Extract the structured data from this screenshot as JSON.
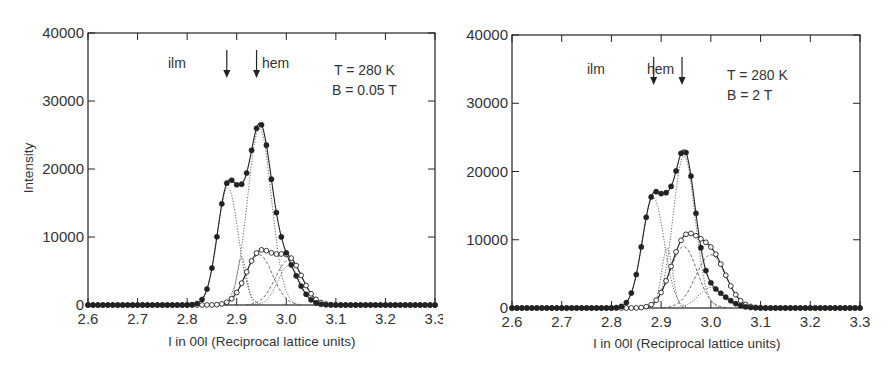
{
  "chart_data": [
    {
      "type": "line",
      "title": "",
      "xlabel": "l in 00l (Reciprocal lattice units)",
      "ylabel": "Intensity",
      "xlim": [
        2.6,
        3.3
      ],
      "ylim": [
        0,
        40000
      ],
      "xticks": [
        "2.6",
        "2.7",
        "2.8",
        "2.9",
        "3.0",
        "3.1",
        "3.2",
        "3.3"
      ],
      "yticks": [
        "0",
        "10000",
        "20000",
        "30000",
        "40000"
      ],
      "grid": false,
      "legend": null,
      "annotations": {
        "ilm_label": "ilm",
        "hem_label": "hem",
        "ilm_arrow_x": 2.88,
        "hem_arrow_x": 2.94,
        "temperature": "T = 280 K",
        "field": "B = 0.05 T"
      },
      "series": [
        {
          "name": "filled circles (total intensity, fit)",
          "marker": "filled-circle",
          "line": "solid",
          "components": [
            {
              "center": 2.882,
              "amplitude": 17300,
              "sigma": 0.021
            },
            {
              "center": 2.946,
              "amplitude": 26000,
              "sigma": 0.024
            },
            {
              "center": 2.91,
              "amplitude": 2200,
              "sigma": 0.012
            },
            {
              "center": 3.0,
              "amplitude": 5600,
              "sigma": 0.025
            }
          ],
          "peak": {
            "x": 2.92,
            "y": 31300
          }
        },
        {
          "name": "open circles (fit)",
          "marker": "open-circle",
          "line": "solid",
          "components": [
            {
              "center": 2.945,
              "amplitude": 7400,
              "sigma": 0.027
            },
            {
              "center": 3.005,
              "amplitude": 6600,
              "sigma": 0.027
            }
          ],
          "peak": {
            "x": 2.975,
            "y": 8700
          }
        }
      ],
      "dotted_components": [
        {
          "center": 2.882,
          "amplitude": 17300,
          "sigma": 0.021
        },
        {
          "center": 2.946,
          "amplitude": 26000,
          "sigma": 0.024
        },
        {
          "center": 2.91,
          "amplitude": 7000,
          "sigma": 0.01
        },
        {
          "center": 3.005,
          "amplitude": 5800,
          "sigma": 0.022
        }
      ],
      "dashed_components": [
        {
          "center": 2.945,
          "amplitude": 7400,
          "sigma": 0.027
        },
        {
          "center": 3.005,
          "amplitude": 6600,
          "sigma": 0.027
        }
      ]
    },
    {
      "type": "line",
      "title": "",
      "xlabel": "l in 00l (Reciprocal lattice units)",
      "ylabel": "",
      "xlim": [
        2.6,
        3.3
      ],
      "ylim": [
        0,
        40000
      ],
      "xticks": [
        "2.6",
        "2.7",
        "2.8",
        "2.9",
        "3.0",
        "3.1",
        "3.2",
        "3.3"
      ],
      "yticks": [
        "0",
        "10000",
        "20000",
        "30000",
        "40000"
      ],
      "grid": false,
      "legend": null,
      "annotations": {
        "ilm_label": "ilm",
        "hem_label": "hem",
        "ilm_arrow_x": 2.885,
        "hem_arrow_x": 2.942,
        "temperature": "T = 280 K",
        "field": "B = 2 T"
      },
      "series": [
        {
          "name": "filled circles (total intensity, fit)",
          "marker": "filled-circle",
          "line": "solid",
          "components": [
            {
              "center": 2.884,
              "amplitude": 16200,
              "sigma": 0.022
            },
            {
              "center": 2.946,
              "amplitude": 22300,
              "sigma": 0.022
            },
            {
              "center": 2.912,
              "amplitude": 3000,
              "sigma": 0.012
            },
            {
              "center": 3.0,
              "amplitude": 2600,
              "sigma": 0.03
            }
          ],
          "peak": {
            "x": 2.91,
            "y": 29200
          }
        },
        {
          "name": "open circles (fit)",
          "marker": "open-circle",
          "line": "solid",
          "components": [
            {
              "center": 2.945,
              "amplitude": 9000,
              "sigma": 0.027
            },
            {
              "center": 3.0,
              "amplitude": 7800,
              "sigma": 0.03
            }
          ],
          "peak": {
            "x": 2.97,
            "y": 12200
          }
        }
      ],
      "dotted_components": [
        {
          "center": 2.884,
          "amplitude": 16200,
          "sigma": 0.022
        },
        {
          "center": 2.946,
          "amplitude": 22300,
          "sigma": 0.022
        },
        {
          "center": 2.912,
          "amplitude": 8800,
          "sigma": 0.011
        },
        {
          "center": 3.0,
          "amplitude": 3000,
          "sigma": 0.025
        }
      ],
      "dashed_components": [
        {
          "center": 2.945,
          "amplitude": 9000,
          "sigma": 0.027
        },
        {
          "center": 3.0,
          "amplitude": 7800,
          "sigma": 0.03
        }
      ]
    }
  ],
  "panels": [
    {
      "ylabel": "Intensity",
      "xlabel": "l in 00l (Reciprocal lattice units)",
      "ilm": "ilm",
      "hem": "hem",
      "temp": "T = 280 K",
      "field": "B = 0.05 T",
      "yticks": [
        "0",
        "10000",
        "20000",
        "30000",
        "40000"
      ],
      "xticks": [
        "2.6",
        "2.7",
        "2.8",
        "2.9",
        "3.0",
        "3.1",
        "3.2",
        "3.3"
      ]
    },
    {
      "ylabel": "",
      "xlabel": "l in 00l (Reciprocal lattice units)",
      "ilm": "ilm",
      "hem": "hem",
      "temp": "T = 280 K",
      "field": "B = 2 T",
      "yticks": [
        "0",
        "10000",
        "20000",
        "30000",
        "40000"
      ],
      "xticks": [
        "2.6",
        "2.7",
        "2.8",
        "2.9",
        "3.0",
        "3.1",
        "3.2",
        "3.3"
      ]
    }
  ],
  "colors": {
    "ink": "#222222",
    "component": "#555555",
    "background": "#ffffff"
  }
}
